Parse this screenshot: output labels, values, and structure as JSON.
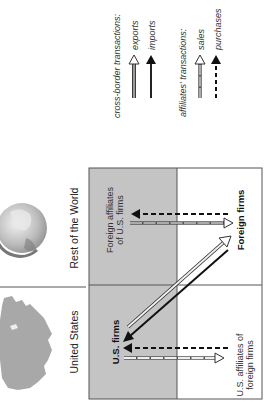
{
  "legend": {
    "cross_border": {
      "title": "cross-border transactions:",
      "items": [
        {
          "label": "exports",
          "style": "hollow-gray-solid"
        },
        {
          "label": "imports",
          "style": "solid-black"
        }
      ]
    },
    "affiliates": {
      "title": "affiliates' transactions:",
      "items": [
        {
          "label": "sales",
          "style": "hollow-gray-dashed"
        },
        {
          "label": "purchases",
          "style": "black-dashed"
        }
      ]
    }
  },
  "regions": {
    "rest_of_world": {
      "label": "Rest of the World",
      "icon": "globe-icon"
    },
    "united_states": {
      "label": "United States",
      "icon": "us-map-icon"
    }
  },
  "nodes": {
    "foreign_affiliates": {
      "line1": "Foreign affiliates",
      "line2": "of U.S. firms"
    },
    "foreign_firms": {
      "label": "Foreign firms"
    },
    "us_firms": {
      "label": "U.S. firms"
    },
    "us_affiliates": {
      "line1": "U.S. affiliates of",
      "line2": "foreign firms"
    }
  },
  "colors": {
    "panel_gray": "#c4c4c4",
    "line": "#555555",
    "arrow_black": "#111111",
    "arrow_gray": "#9a9a9a",
    "map_gray": "#a8a8a8"
  }
}
